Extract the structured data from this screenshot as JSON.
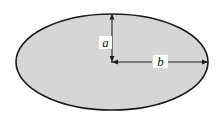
{
  "figure": {
    "kind": "geometry-diagram",
    "background_color": "#ffffff"
  },
  "ellipse": {
    "name": "ellipse-shape",
    "center_x": 112,
    "center_y": 62,
    "semi_major_px": 96,
    "semi_minor_px": 48,
    "fill_color": "#d6d6d6",
    "stroke_color": "#1a1a1a",
    "stroke_width": 1.6
  },
  "dimensions": [
    {
      "id": "semi-minor",
      "label": "a",
      "orientation": "vertical",
      "from_x": 112,
      "from_y": 62,
      "to_x": 112,
      "to_y": 14,
      "arrow_color": "#1a1a1a",
      "label_position": "left-of-line"
    },
    {
      "id": "semi-major",
      "label": "b",
      "orientation": "horizontal",
      "from_x": 112,
      "from_y": 62,
      "to_x": 208,
      "to_y": 62,
      "arrow_color": "#1a1a1a",
      "label_position": "on-line-centered"
    }
  ],
  "labels": {
    "a": "a",
    "b": "b"
  }
}
